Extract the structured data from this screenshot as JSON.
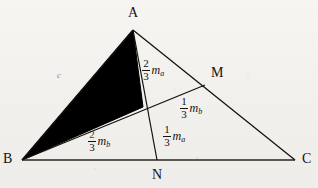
{
  "figure": {
    "type": "geometry-diagram",
    "colors": {
      "ink": "#16110e",
      "shade_fill": "#000000",
      "paper": "#f4f3f0",
      "faint_ink": "#8d8880"
    }
  },
  "vertices": [
    {
      "id": "A",
      "label": "A",
      "x": 133,
      "y": 30
    },
    {
      "id": "B",
      "label": "B",
      "x": 22,
      "y": 160
    },
    {
      "id": "C",
      "label": "C",
      "x": 295,
      "y": 160
    },
    {
      "id": "M",
      "label": "M",
      "x": 205,
      "y": 85
    },
    {
      "id": "N",
      "label": "N",
      "x": 157,
      "y": 160
    }
  ],
  "centroid": {
    "id": "G",
    "x": 143,
    "y": 107
  },
  "vertex_label_positions": [
    {
      "for": "A",
      "x": 128,
      "y": 6
    },
    {
      "for": "B",
      "x": 3,
      "y": 158
    },
    {
      "for": "C",
      "x": 302,
      "y": 158
    },
    {
      "for": "M",
      "x": 211,
      "y": 70
    },
    {
      "for": "N",
      "x": 152,
      "y": 170
    }
  ],
  "segments": [
    {
      "name": "side-AB",
      "from": "A",
      "to": "B"
    },
    {
      "name": "side-BC",
      "from": "B",
      "to": "C"
    },
    {
      "name": "side-CA",
      "from": "C",
      "to": "A"
    },
    {
      "name": "median-AN",
      "from": "A",
      "to": "N"
    },
    {
      "name": "median-BM",
      "from": "B",
      "to": "M"
    }
  ],
  "side_labels": [
    {
      "name": "side-label-c",
      "text": "c",
      "x": 57,
      "y": 73
    }
  ],
  "measure_labels": [
    {
      "name": "measure-an-upper",
      "numerator": "2",
      "denominator": "3",
      "symbol": "m",
      "subscript": "a",
      "segment": "A-to-centroid",
      "x": 142,
      "y": 60
    },
    {
      "name": "measure-an-lower",
      "numerator": "1",
      "denominator": "3",
      "symbol": "m",
      "subscript": "a",
      "segment": "centroid-to-N",
      "x": 163,
      "y": 126
    },
    {
      "name": "measure-bm-upper",
      "numerator": "1",
      "denominator": "3",
      "symbol": "m",
      "subscript": "b",
      "segment": "centroid-to-M",
      "x": 180,
      "y": 98
    },
    {
      "name": "measure-bm-lower",
      "numerator": "2",
      "denominator": "3",
      "symbol": "m",
      "subscript": "b",
      "segment": "B-to-centroid",
      "x": 88,
      "y": 131
    }
  ]
}
